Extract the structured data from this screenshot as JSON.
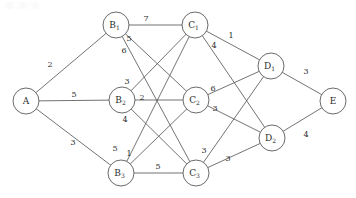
{
  "diagram": {
    "stroke_color": "#5a5a5a",
    "node_fill": "#ffffff",
    "text_color": "#2b2b2b",
    "width": 356,
    "height": 198
  },
  "nodes": [
    {
      "id": "A",
      "base": "A",
      "sub": "",
      "x": 26,
      "y": 101,
      "r": 13
    },
    {
      "id": "B1",
      "base": "B",
      "sub": "1",
      "x": 116,
      "y": 25,
      "r": 13
    },
    {
      "id": "B2",
      "base": "B",
      "sub": "2",
      "x": 122,
      "y": 100,
      "r": 13
    },
    {
      "id": "B3",
      "base": "B",
      "sub": "3",
      "x": 121,
      "y": 173,
      "r": 13
    },
    {
      "id": "C1",
      "base": "C",
      "sub": "1",
      "x": 195,
      "y": 25,
      "r": 13
    },
    {
      "id": "C2",
      "base": "C",
      "sub": "2",
      "x": 196,
      "y": 100,
      "r": 13
    },
    {
      "id": "C3",
      "base": "C",
      "sub": "3",
      "x": 196,
      "y": 173,
      "r": 13
    },
    {
      "id": "D1",
      "base": "D",
      "sub": "1",
      "x": 271,
      "y": 66,
      "r": 13
    },
    {
      "id": "D2",
      "base": "D",
      "sub": "2",
      "x": 272,
      "y": 138,
      "r": 13
    },
    {
      "id": "E",
      "base": "E",
      "sub": "",
      "x": 333,
      "y": 101,
      "r": 13
    }
  ],
  "edges": [
    {
      "from": "A",
      "to": "B1",
      "weight": "2",
      "lx": 50,
      "ly": 64
    },
    {
      "from": "A",
      "to": "B2",
      "weight": "5",
      "lx": 74,
      "ly": 94
    },
    {
      "from": "A",
      "to": "B3",
      "weight": "3",
      "lx": 73,
      "ly": 142
    },
    {
      "from": "B1",
      "to": "C1",
      "weight": "7",
      "lx": 146,
      "ly": 18
    },
    {
      "from": "B1",
      "to": "C2",
      "weight": "5",
      "lx": 129,
      "ly": 38
    },
    {
      "from": "B1",
      "to": "C3",
      "weight": "6",
      "lx": 124,
      "ly": 50
    },
    {
      "from": "B2",
      "to": "C1",
      "weight": "3",
      "lx": 127,
      "ly": 81
    },
    {
      "from": "B2",
      "to": "C2",
      "weight": "2",
      "lx": 142,
      "ly": 97
    },
    {
      "from": "B2",
      "to": "C3",
      "weight": "4",
      "lx": 125,
      "ly": 119
    },
    {
      "from": "B3",
      "to": "C1",
      "weight": "5",
      "lx": 115,
      "ly": 148
    },
    {
      "from": "B3",
      "to": "C2",
      "weight": "1",
      "lx": 129,
      "ly": 153
    },
    {
      "from": "B3",
      "to": "C3",
      "weight": "5",
      "lx": 158,
      "ly": 166
    },
    {
      "from": "C1",
      "to": "D1",
      "weight": "1",
      "lx": 231,
      "ly": 35
    },
    {
      "from": "C1",
      "to": "D2",
      "weight": "4",
      "lx": 214,
      "ly": 45
    },
    {
      "from": "C2",
      "to": "D1",
      "weight": "6",
      "lx": 213,
      "ly": 88
    },
    {
      "from": "C2",
      "to": "D2",
      "weight": "3",
      "lx": 215,
      "ly": 108
    },
    {
      "from": "C3",
      "to": "D1",
      "weight": "3",
      "lx": 204,
      "ly": 150
    },
    {
      "from": "C3",
      "to": "D2",
      "weight": "3",
      "lx": 228,
      "ly": 158
    },
    {
      "from": "D1",
      "to": "E",
      "weight": "3",
      "lx": 306,
      "ly": 71
    },
    {
      "from": "D2",
      "to": "E",
      "weight": "4",
      "lx": 306,
      "ly": 134
    }
  ]
}
